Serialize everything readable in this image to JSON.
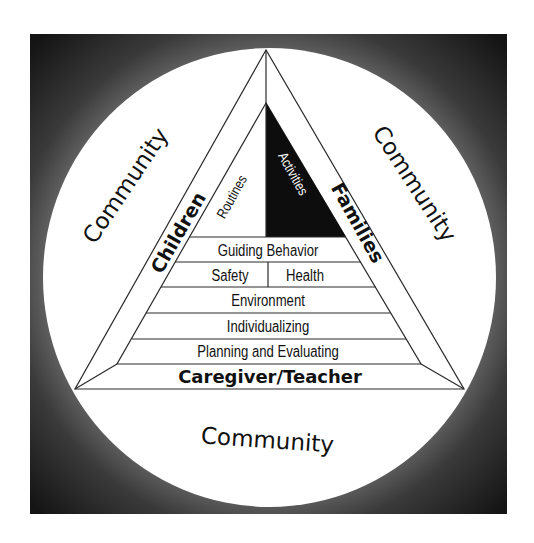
{
  "diagram": {
    "colors": {
      "background_dark": "#1a1a1a",
      "background_mid": "#6a6a6a",
      "circle_fill": "#ffffff",
      "line": "#2a2a2a",
      "activities_fill": "#0d0d0d",
      "text": "#111111"
    },
    "outer_labels": {
      "community_left": "Community",
      "community_right": "Community",
      "community_bottom": "Community"
    },
    "side_labels": {
      "left": "Children",
      "right": "Families",
      "base": "Caregiver/Teacher"
    },
    "top_sections": {
      "left": "Routines",
      "right": "Activities"
    },
    "levels": [
      {
        "label": "Guiding Behavior"
      },
      {
        "left": "Safety",
        "right": "Health"
      },
      {
        "label": "Environment"
      },
      {
        "label": "Individualizing"
      },
      {
        "label": "Planning and Evaluating"
      }
    ]
  }
}
